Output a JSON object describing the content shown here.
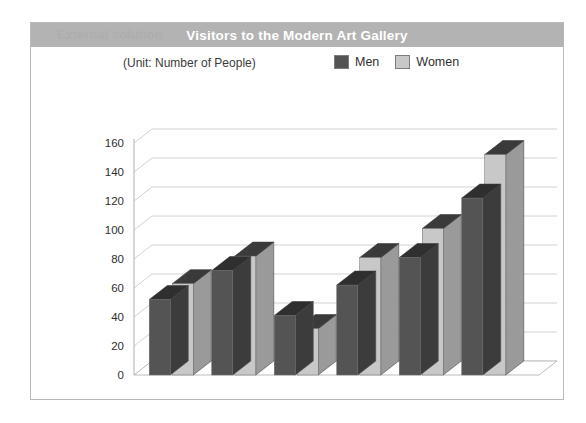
{
  "title": "Visitors to the Modern Art Gallery",
  "title_watermark": "External solution",
  "unit_label": "(Unit: Number of People)",
  "legend": [
    {
      "label": "Men",
      "color": "#545454"
    },
    {
      "label": "Women",
      "color": "#c8c8c8"
    }
  ],
  "colors": {
    "men": "#545454",
    "men_top": "#2f2f2f",
    "men_side": "#3c3c3c",
    "women": "#c8c8c8",
    "women_top": "#3a3a3a",
    "women_side": "#9a9a9a",
    "title_bar": "#b3b3b3",
    "gridline": "#d2d2d2",
    "frame": "#b9b9b9"
  },
  "chart_data": {
    "type": "bar",
    "title": "Visitors to the Modern Art Gallery",
    "subtitle": "(Unit: Number of People)",
    "xlabel": "",
    "ylabel": "",
    "ylim": [
      0,
      160
    ],
    "ytick_step": 20,
    "yticks": [
      0,
      20,
      40,
      60,
      80,
      100,
      120,
      140,
      160
    ],
    "grid": true,
    "legend_position": "top-right",
    "style": "3d-bar",
    "categories": [
      "March",
      "April",
      "May",
      "June",
      "July",
      "August"
    ],
    "series": [
      {
        "name": "Men",
        "color": "#545454",
        "values": [
          52,
          72,
          41,
          62,
          81,
          122
        ]
      },
      {
        "name": "Women",
        "color": "#c8c8c8",
        "values": [
          63,
          82,
          32,
          81,
          101,
          152
        ]
      }
    ]
  }
}
